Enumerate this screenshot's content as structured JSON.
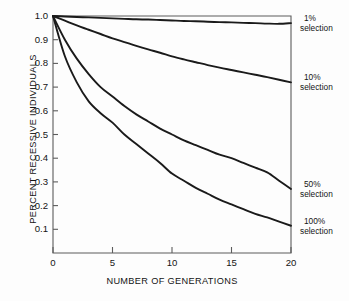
{
  "chart_data": {
    "type": "line",
    "title": "",
    "xlabel": "NUMBER OF GENERATIONS",
    "ylabel": "PERCENT RECESSIVE INDIVIDUALS",
    "xlim": [
      0,
      20
    ],
    "ylim": [
      0,
      1.0
    ],
    "grid": false,
    "legend_position": "right-inline",
    "xticks": [
      "0",
      "5",
      "10",
      "15",
      "20"
    ],
    "xtick_values": [
      0,
      5,
      10,
      15,
      20
    ],
    "yticks": [
      "0.1",
      "0.2",
      "0.3",
      "0.4",
      "0.5",
      "0.6",
      "0.7",
      "0.8",
      "0.9",
      "1.0"
    ],
    "ytick_values": [
      0.1,
      0.2,
      0.3,
      0.4,
      0.5,
      0.6,
      0.7,
      0.8,
      0.9,
      1.0
    ],
    "x": [
      0,
      1,
      2,
      3,
      4,
      5,
      6,
      7,
      8,
      9,
      10,
      11,
      12,
      13,
      14,
      15,
      16,
      17,
      18,
      19,
      20
    ],
    "series": [
      {
        "name": "1% selection",
        "label_pct": "1%",
        "label_sel": "selection",
        "color": "#1a1a1a",
        "end_value": 0.97,
        "values": [
          1.0,
          0.998,
          0.996,
          0.994,
          0.992,
          0.99,
          0.988,
          0.986,
          0.985,
          0.983,
          0.981,
          0.979,
          0.978,
          0.976,
          0.974,
          0.973,
          0.971,
          0.97,
          0.968,
          0.967,
          0.97
        ]
      },
      {
        "name": "10% selection",
        "label_pct": "10%",
        "label_sel": "selection",
        "color": "#1a1a1a",
        "end_value": 0.72,
        "values": [
          1.0,
          0.98,
          0.96,
          0.942,
          0.924,
          0.906,
          0.89,
          0.874,
          0.859,
          0.845,
          0.83,
          0.817,
          0.805,
          0.793,
          0.782,
          0.772,
          0.762,
          0.752,
          0.742,
          0.731,
          0.72
        ]
      },
      {
        "name": "50% selection",
        "label_pct": "50%",
        "label_sel": "selection",
        "color": "#1a1a1a",
        "end_value": 0.27,
        "values": [
          1.0,
          0.9,
          0.82,
          0.755,
          0.7,
          0.66,
          0.62,
          0.585,
          0.555,
          0.525,
          0.5,
          0.475,
          0.455,
          0.435,
          0.415,
          0.4,
          0.38,
          0.36,
          0.34,
          0.305,
          0.27
        ]
      },
      {
        "name": "100% selection",
        "label_pct": "100%",
        "label_sel": "selection",
        "color": "#1a1a1a",
        "end_value": 0.115,
        "values": [
          1.0,
          0.83,
          0.72,
          0.64,
          0.59,
          0.55,
          0.5,
          0.46,
          0.42,
          0.38,
          0.335,
          0.305,
          0.275,
          0.25,
          0.225,
          0.205,
          0.185,
          0.165,
          0.15,
          0.132,
          0.115
        ]
      }
    ]
  }
}
